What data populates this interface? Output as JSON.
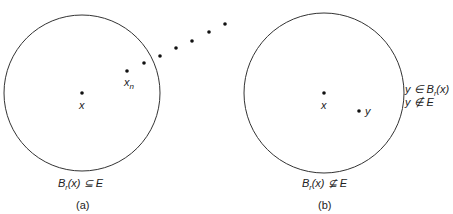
{
  "panel_a": {
    "caption": "(a)",
    "center_label": "x",
    "seq_label": "x",
    "seq_sub": "n",
    "ball_label": "B",
    "ball_sub": "r",
    "ball_rest": "(x) ⊆ E",
    "circle": {
      "cx": 82,
      "cy": 93,
      "r": 78
    },
    "center_dot": [
      82,
      93
    ],
    "xn_dot": [
      127,
      71
    ],
    "sequence_dots": [
      [
        144,
        63
      ],
      [
        160,
        56
      ],
      [
        176,
        48
      ],
      [
        192,
        41
      ],
      [
        209,
        32
      ],
      [
        225,
        24
      ]
    ]
  },
  "panel_b": {
    "caption": "(b)",
    "center_label": "x",
    "y_label": "y",
    "ball_label": "B",
    "ball_sub": "r",
    "ball_rest": "(x) ⊈ E",
    "side_line1_pre": "y ∈ B",
    "side_line1_sub": "r",
    "side_line1_post": "(x)",
    "side_line2": "y ∉ E",
    "circle": {
      "cx": 324,
      "cy": 93,
      "r": 80
    },
    "center_dot": [
      324,
      93
    ],
    "y_dot": [
      359,
      111
    ]
  },
  "colors": {
    "stroke": "#333333",
    "dot": "#111111"
  }
}
